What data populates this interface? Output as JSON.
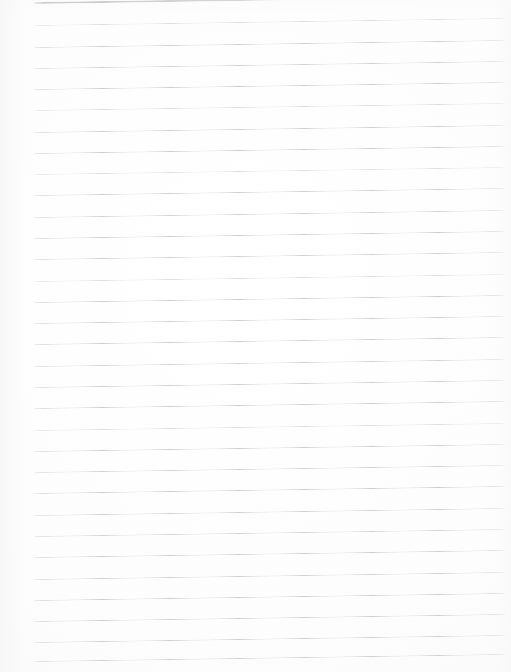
{
  "document": {
    "kind": "scanned-ruled-paper",
    "title": "Blank ruled notebook page",
    "page_width": 511,
    "page_height": 672,
    "content_text": "",
    "handwriting": "none",
    "printed_text": "none"
  },
  "colors": {
    "page_background": "#fefefe",
    "paper_tint": "#fafafa",
    "rule_line": "#c9c9c9",
    "rule_line_faint": "#d6d6d6",
    "header_rule_line": "#9e9e9e"
  },
  "ruling": {
    "line_count": 31,
    "left_margin_px": 34,
    "right_edge_px": 505,
    "line_spacing_px": 21.2,
    "first_line_y_px": 2,
    "slant_degrees": -0.85,
    "header_rule_index": 0,
    "header_rule_thickness_px": 2,
    "body_rule_thickness_px": 1,
    "lines": [
      {
        "index": 0,
        "y": 2,
        "weight": "heavy",
        "opacity": 1.0
      },
      {
        "index": 1,
        "y": 25,
        "weight": "light",
        "opacity": 0.8
      },
      {
        "index": 2,
        "y": 47,
        "weight": "light",
        "opacity": 0.92
      },
      {
        "index": 3,
        "y": 68,
        "weight": "light",
        "opacity": 0.88
      },
      {
        "index": 4,
        "y": 89,
        "weight": "light",
        "opacity": 0.95
      },
      {
        "index": 5,
        "y": 110,
        "weight": "light",
        "opacity": 0.85
      },
      {
        "index": 6,
        "y": 132,
        "weight": "light",
        "opacity": 0.9
      },
      {
        "index": 7,
        "y": 153,
        "weight": "light",
        "opacity": 0.95
      },
      {
        "index": 8,
        "y": 174,
        "weight": "light",
        "opacity": 0.78
      },
      {
        "index": 9,
        "y": 195,
        "weight": "light",
        "opacity": 0.92
      },
      {
        "index": 10,
        "y": 217,
        "weight": "light",
        "opacity": 0.86
      },
      {
        "index": 11,
        "y": 238,
        "weight": "light",
        "opacity": 0.95
      },
      {
        "index": 12,
        "y": 259,
        "weight": "light",
        "opacity": 0.88
      },
      {
        "index": 13,
        "y": 281,
        "weight": "light",
        "opacity": 0.82
      },
      {
        "index": 14,
        "y": 302,
        "weight": "light",
        "opacity": 0.95
      },
      {
        "index": 15,
        "y": 323,
        "weight": "light",
        "opacity": 0.9
      },
      {
        "index": 16,
        "y": 344,
        "weight": "light",
        "opacity": 0.94
      },
      {
        "index": 17,
        "y": 366,
        "weight": "light",
        "opacity": 0.86
      },
      {
        "index": 18,
        "y": 387,
        "weight": "light",
        "opacity": 0.92
      },
      {
        "index": 19,
        "y": 408,
        "weight": "light",
        "opacity": 0.95
      },
      {
        "index": 20,
        "y": 430,
        "weight": "light",
        "opacity": 0.84
      },
      {
        "index": 21,
        "y": 451,
        "weight": "light",
        "opacity": 0.93
      },
      {
        "index": 22,
        "y": 472,
        "weight": "light",
        "opacity": 0.88
      },
      {
        "index": 23,
        "y": 493,
        "weight": "light",
        "opacity": 0.95
      },
      {
        "index": 24,
        "y": 515,
        "weight": "light",
        "opacity": 0.9
      },
      {
        "index": 25,
        "y": 536,
        "weight": "light",
        "opacity": 0.86
      },
      {
        "index": 26,
        "y": 557,
        "weight": "light",
        "opacity": 0.94
      },
      {
        "index": 27,
        "y": 579,
        "weight": "light",
        "opacity": 0.9
      },
      {
        "index": 28,
        "y": 600,
        "weight": "light",
        "opacity": 0.95
      },
      {
        "index": 29,
        "y": 621,
        "weight": "light",
        "opacity": 0.92
      },
      {
        "index": 30,
        "y": 642,
        "weight": "light",
        "opacity": 0.9
      },
      {
        "index": 31,
        "y": 661,
        "weight": "light",
        "opacity": 0.88
      }
    ]
  }
}
